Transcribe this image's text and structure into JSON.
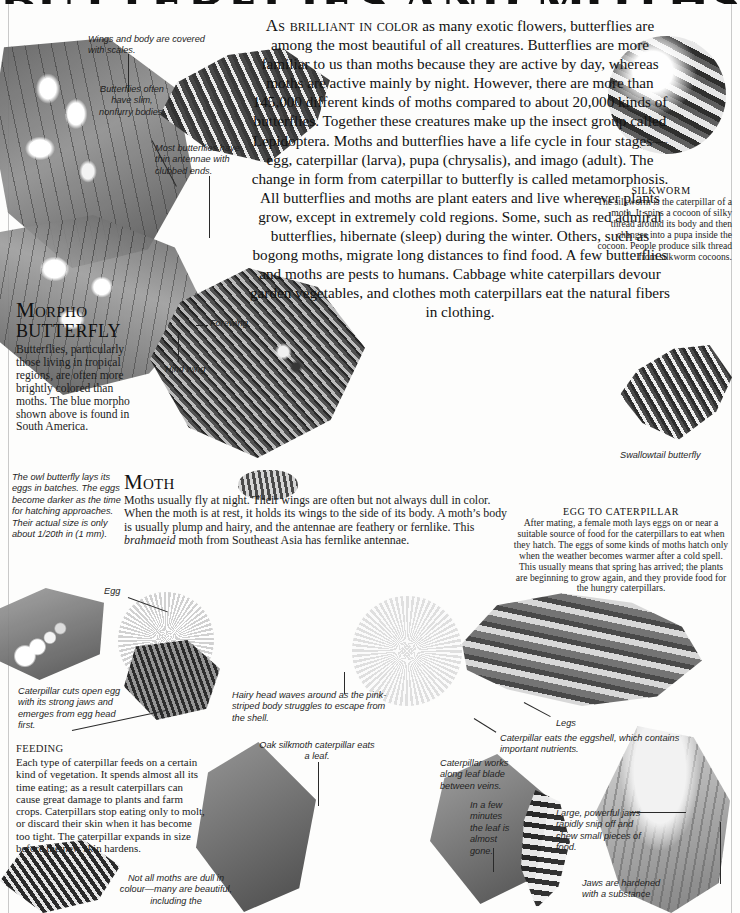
{
  "page": {
    "title": "BUTTERFLIES AND MOTHS"
  },
  "intro": {
    "lead_in": "As brilliant in color",
    "text": " as many exotic flowers, butterflies are among the most beautiful of all creatures. Butterflies are more familiar to us than moths because they are active by day, whereas moths are active mainly by night. However, there are more than 145,000 different kinds of moths compared to about 20,000 kinds of butterflies. Together these creatures make up the insect group called Lepidoptera. Moths and butterflies have a life cycle in four stages—egg, caterpillar (larva), pupa (chrysalis), and imago (adult). The change in form from caterpillar to butterfly is called metamorphosis. All butterflies and moths are plant eaters and live wherever plants grow, except in extremely cold regions. Some, such as red admiral butterflies, hibernate (sleep) during the winter. Others, such as bogong moths, migrate long distances to find food. A few butterflies and moths are pests to humans. Cabbage white caterpillars devour garden vegetables, and clothes moth caterpillars eat the natural fibers in clothing."
  },
  "labels": {
    "scales": "Wings and body are covered with scales.",
    "slim_bodies": "Butterflies often have slim, nonfurry bodies.",
    "antennae": "Most butterflies have thin antennae with clubbed ends.",
    "forewing": "Forewing",
    "hind_wing": "Hind wing",
    "swallowtail": "Swallowtail butterfly",
    "owl_eggs": "The owl butterfly lays its eggs in batches. The eggs become darker as the time for hatching approaches. Their actual size is only about 1/20th in (1 mm).",
    "egg": "Egg",
    "caterpillar_cuts": "Caterpillar cuts open egg with its strong jaws and emerges from egg head first.",
    "hairy_head": "Hairy head waves around as the pink-striped body struggles to escape from the shell.",
    "legs": "Legs",
    "eats_eggshell": "Caterpillar eats the eggshell, which contains important nutrients.",
    "oak_silkmoth": "Oak silkmoth caterpillar eats a leaf.",
    "leaf_blade": "Caterpillar works along leaf blade between veins.",
    "in_a_few_minutes": "In a few minutes the leaf is almost gone.",
    "jaws_snip": "Large, powerful jaws rapidly snip off and chew small pieces of food.",
    "jaws_hardened": "Jaws are hardened with a substance",
    "not_all_moths": "Not all moths are dull in colour—many are beautiful, including the"
  },
  "sections": {
    "morpho": {
      "heading_line1": "Morpho",
      "heading_line2": "BUTTERFLY",
      "body": "Butterflies, particularly those living in tropical regions, are often more brightly colored than moths. The blue morpho shown above is found in South America."
    },
    "moth": {
      "heading": "Moth",
      "body_part1": "Moths usually fly at night. Their wings are often but not always dull in color. When the moth is at rest, it holds its wings to the side of its body. A moth’s body is usually plump and hairy, and the antennae are feathery or fernlike. This ",
      "body_italic": "brahmaeid",
      "body_part2": " moth from Southeast Asia has fernlike antennae."
    },
    "silkworm": {
      "heading": "SILKWORM",
      "body": "The silkworm is the caterpillar of a moth. It spins a cocoon of silky thread around its body and then changes into a pupa inside the cocoon. People produce silk thread from silkworm cocoons."
    },
    "egg_to_caterpillar": {
      "heading": "EGG TO CATERPILLAR",
      "body": "After mating, a female moth lays eggs on or near a suitable source of food for the caterpillars to eat when they hatch. The eggs of some kinds of moths hatch only when the weather becomes warmer after a cold spell. This usually means that spring has arrived; the plants are beginning to grow again, and they provide food for the hungry caterpillars."
    },
    "feeding": {
      "heading": "FEEDING",
      "body": "Each type of caterpillar feeds on a certain kind of vegetation. It spends almost all its time eating; as a result caterpillars can cause great damage to plants and farm crops. Caterpillars stop eating only to molt, or discard their skin when it has become too tight. The caterpillar expands in size before the new skin hardens."
    }
  }
}
